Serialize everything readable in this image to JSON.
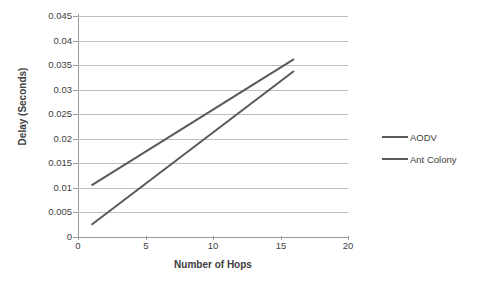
{
  "chart_data": {
    "type": "line",
    "title": "",
    "xlabel": "Number of Hops",
    "ylabel": "Delay (Seconds)",
    "xlim": [
      0,
      20
    ],
    "ylim": [
      0,
      0.045
    ],
    "x_ticks": [
      "0",
      "5",
      "10",
      "15",
      "20"
    ],
    "x_tick_values": [
      0,
      5,
      10,
      15,
      20
    ],
    "y_ticks": [
      "0",
      "0.005",
      "0.01",
      "0.015",
      "0.02",
      "0.025",
      "0.03",
      "0.035",
      "0.04",
      "0.045"
    ],
    "y_tick_values": [
      0,
      0.005,
      0.01,
      0.015,
      0.02,
      0.025,
      0.03,
      0.035,
      0.04,
      0.045
    ],
    "grid": true,
    "legend_position": "right",
    "x": [
      1,
      16
    ],
    "series": [
      {
        "name": "AODV",
        "color": "#595959",
        "values": [
          0.0105,
          0.0362
        ]
      },
      {
        "name": "Ant Colony",
        "color": "#595959",
        "values": [
          0.0025,
          0.0338
        ]
      }
    ]
  },
  "legend": {
    "items": [
      {
        "label": "AODV"
      },
      {
        "label": "Ant Colony"
      }
    ]
  },
  "axes": {
    "x_title": "Number of Hops",
    "y_title": "Delay (Seconds)"
  },
  "colors": {
    "series_line": "#595959",
    "gridline": "#bfbfbf",
    "axis": "#9a9a9a",
    "text": "#404040",
    "background": "#ffffff"
  }
}
